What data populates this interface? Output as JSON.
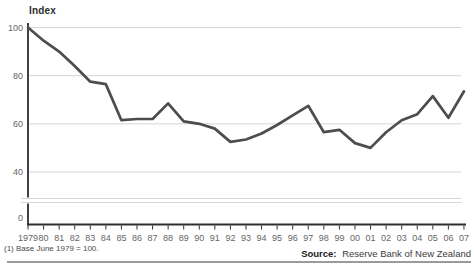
{
  "figure": {
    "title": "Index",
    "footnote": "(1) Base June 1979 = 100.",
    "source": {
      "label": "Source:",
      "text": "Reserve Bank of New Zealand"
    }
  },
  "chart_data": {
    "type": "line",
    "title": "Index",
    "categories": [
      "1979",
      "80",
      "81",
      "82",
      "83",
      "84",
      "85",
      "86",
      "87",
      "88",
      "89",
      "90",
      "91",
      "92",
      "93",
      "94",
      "95",
      "96",
      "97",
      "98",
      "99",
      "00",
      "01",
      "02",
      "03",
      "04",
      "05",
      "06",
      "07"
    ],
    "values": [
      100,
      94.5,
      90,
      84,
      77.5,
      76.5,
      61.5,
      62,
      62,
      68.5,
      61,
      60,
      58,
      52.5,
      53.5,
      56,
      59.5,
      63.5,
      67.5,
      56.5,
      57.5,
      52,
      50,
      56.5,
      61.5,
      64,
      71.5,
      62.5,
      73.5
    ],
    "ylabel": "Index",
    "xlabel": "",
    "yticks": [
      100,
      80,
      60,
      40,
      0
    ],
    "ylim": [
      0,
      100
    ],
    "axis_break": {
      "between": [
        0,
        40
      ]
    },
    "grid": "horizontal",
    "legend": "none",
    "line_color": "#4d4d4d",
    "grid_color": "#d6d6d6",
    "axis_color": "#2e2e2e",
    "tick_label_color": "#666666",
    "footnote": "(1) Base June 1979 = 100.",
    "source": "Source: Reserve Bank of New Zealand"
  }
}
